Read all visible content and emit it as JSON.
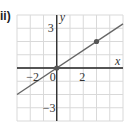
{
  "label": "ii)",
  "colors": {
    "grid": "#d9d9d9",
    "axis": "#222222",
    "line": "#666666",
    "point": "#555555"
  },
  "chart_data": {
    "type": "line",
    "title": "",
    "xlabel": "x",
    "ylabel": "y",
    "xlim": [
      -3,
      5
    ],
    "ylim": [
      -4,
      4
    ],
    "grid": true,
    "x_ticks_labeled": [
      {
        "value": -2,
        "label": "−2"
      },
      {
        "value": 0,
        "label": "0"
      },
      {
        "value": 2,
        "label": "2"
      }
    ],
    "y_ticks_labeled": [
      {
        "value": 3,
        "label": "3"
      },
      {
        "value": -3,
        "label": "−3"
      }
    ],
    "series": [
      {
        "name": "y = (2/3)x",
        "x": [
          -3,
          5
        ],
        "y": [
          -2,
          3.333
        ]
      }
    ],
    "points": [
      {
        "x": 0,
        "y": 0
      },
      {
        "x": 3,
        "y": 2
      }
    ]
  }
}
